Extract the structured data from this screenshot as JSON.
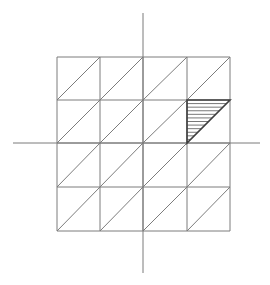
{
  "diagram": {
    "type": "grid-with-shaded-triangle",
    "axes": {
      "horizontal": {
        "x1": 13,
        "x2": 260,
        "y": 143
      },
      "vertical": {
        "x": 143,
        "y1": 13,
        "y2": 273
      }
    },
    "grid": {
      "rows": 4,
      "cols": 4,
      "x_lines": [
        57,
        100,
        143,
        187,
        230
      ],
      "y_lines": [
        57,
        100,
        143,
        187,
        231
      ],
      "diagonal_direction": "bottom-left-to-top-right"
    },
    "shaded_triangle": {
      "cell": {
        "col": 4,
        "row": 2
      },
      "vertices": [
        [
          187,
          100
        ],
        [
          230,
          100
        ],
        [
          187,
          143
        ]
      ],
      "hatch": "horizontal",
      "hatch_line_count": 11
    },
    "colors": {
      "background": "#ffffff",
      "grid_line": "#7c7c7c",
      "axis_line": "#7a7a7a",
      "triangle_outline": "#3f3f3f",
      "hatch_line": "#555555"
    }
  }
}
